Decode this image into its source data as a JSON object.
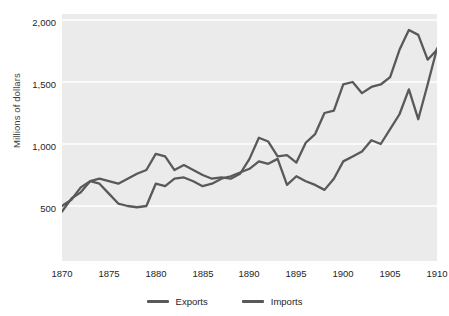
{
  "axes": {
    "ylabel": "Millions of dollars",
    "yticks": [
      "500",
      "1,000",
      "1,500",
      "2,000"
    ],
    "xticks": [
      "1870",
      "1875",
      "1880",
      "1885",
      "1890",
      "1895",
      "1900",
      "1905",
      "1910"
    ]
  },
  "legend": {
    "items": [
      {
        "label": "Exports",
        "color": "#595959"
      },
      {
        "label": "Imports",
        "color": "#595959"
      }
    ]
  },
  "style": {
    "plot_background": "#ebebeb",
    "gridline_color": "#ffffff",
    "line_color": "#595959",
    "text_color": "#262626"
  },
  "chart_data": {
    "type": "line",
    "title": "",
    "xlabel": "",
    "ylabel": "Millions of dollars",
    "xlim": [
      1870,
      1910
    ],
    "ylim": [
      300,
      2050
    ],
    "yticks": [
      500,
      1000,
      1500,
      2000
    ],
    "xticks": [
      1870,
      1875,
      1880,
      1885,
      1890,
      1895,
      1900,
      1905,
      1910
    ],
    "grid": "horizontal",
    "legend_position": "bottom",
    "x": [
      1870,
      1871,
      1872,
      1873,
      1874,
      1875,
      1876,
      1877,
      1878,
      1879,
      1880,
      1881,
      1882,
      1883,
      1884,
      1885,
      1886,
      1887,
      1888,
      1889,
      1890,
      1891,
      1892,
      1893,
      1894,
      1895,
      1896,
      1897,
      1898,
      1899,
      1900,
      1901,
      1902,
      1903,
      1904,
      1905,
      1906,
      1907,
      1908,
      1909,
      1910
    ],
    "series": [
      {
        "name": "Exports",
        "color": "#595959",
        "values": [
          455,
          560,
          610,
          700,
          720,
          700,
          680,
          720,
          760,
          790,
          920,
          900,
          790,
          830,
          790,
          750,
          720,
          730,
          720,
          760,
          880,
          1050,
          1020,
          900,
          910,
          850,
          1010,
          1080,
          1250,
          1270,
          1480,
          1500,
          1410,
          1460,
          1480,
          1540,
          1760,
          1920,
          1880,
          1680,
          1760
        ]
      },
      {
        "name": "Imports",
        "color": "#595959",
        "values": [
          500,
          550,
          650,
          700,
          680,
          600,
          520,
          500,
          490,
          500,
          680,
          660,
          720,
          730,
          700,
          660,
          680,
          720,
          740,
          770,
          800,
          860,
          840,
          880,
          670,
          740,
          700,
          670,
          630,
          720,
          860,
          900,
          940,
          1030,
          1000,
          1120,
          1240,
          1440,
          1200,
          1480,
          1770
        ]
      }
    ]
  }
}
